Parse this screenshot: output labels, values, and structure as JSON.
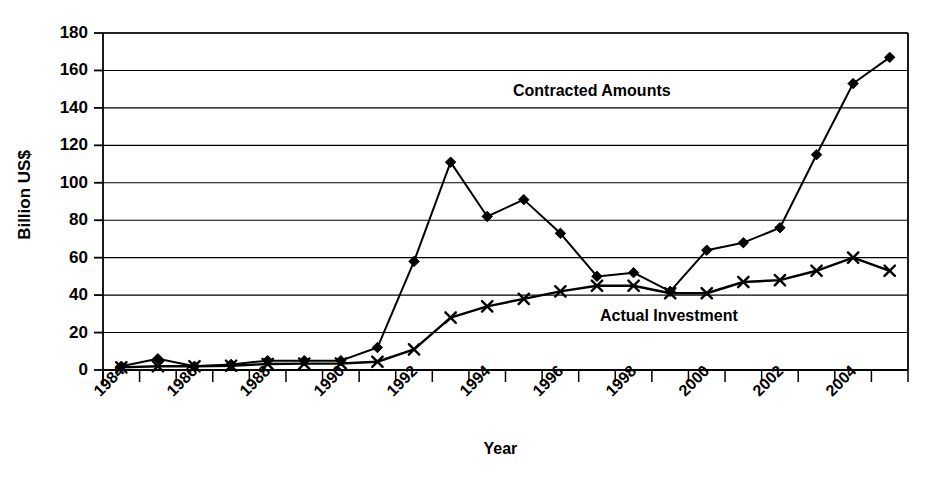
{
  "chart_data": {
    "type": "line",
    "title": "",
    "xlabel": "Year",
    "ylabel": "Billion US$",
    "ylim": [
      0,
      180
    ],
    "ytick_step": 20,
    "yticks": [
      0,
      20,
      40,
      60,
      80,
      100,
      120,
      140,
      160,
      180
    ],
    "grid": true,
    "grid_axis": "y",
    "legend": "inline-annotations",
    "categories": [
      "1984",
      "1985",
      "1986",
      "1987",
      "1988",
      "1989",
      "1990",
      "1991",
      "1992",
      "1993",
      "1994",
      "1995",
      "1996",
      "1997",
      "1998",
      "1999",
      "2000",
      "2001",
      "2002",
      "2003",
      "2004",
      "2005"
    ],
    "xtick_labels": [
      "1984",
      "1986",
      "1988",
      "1990",
      "1992",
      "1994",
      "1996",
      "1998",
      "2000",
      "2002",
      "2004"
    ],
    "xtick_label_rotation": -45,
    "series": [
      {
        "name": "Contracted Amounts",
        "marker": "diamond",
        "color": "#000000",
        "values": [
          2,
          6,
          2,
          3,
          5,
          5,
          5,
          12,
          58,
          111,
          82,
          91,
          73,
          50,
          52,
          42,
          64,
          68,
          76,
          115,
          153,
          167
        ]
      },
      {
        "name": "Actual Investment",
        "marker": "x",
        "color": "#000000",
        "values": [
          1.4,
          2,
          2,
          2.3,
          3.2,
          3.4,
          3.5,
          4.4,
          11,
          28,
          34,
          38,
          42,
          45,
          45,
          41,
          41,
          47,
          48,
          53,
          60,
          53
        ]
      }
    ],
    "annotations": [
      {
        "text": "Contracted Amounts",
        "series": "Contracted Amounts"
      },
      {
        "text": "Actual Investment",
        "series": "Actual Investment"
      }
    ]
  }
}
